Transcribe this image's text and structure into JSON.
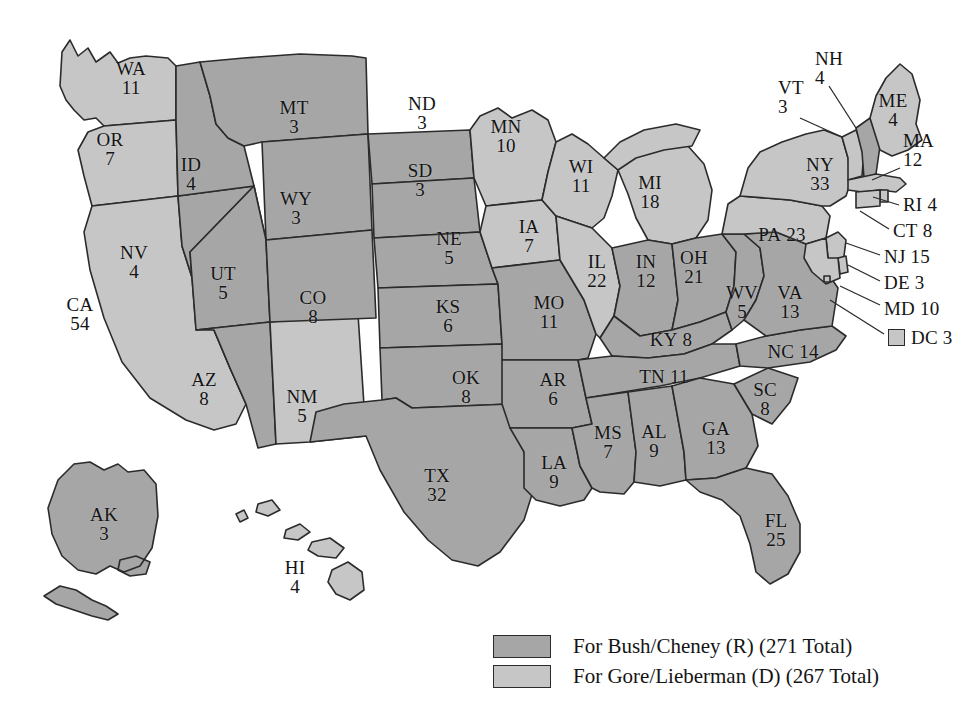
{
  "figure": {
    "colors": {
      "republican_fill": "#a6a6a6",
      "democrat_fill": "#c6c6c6",
      "border": "#2b2b2b",
      "background": "#ffffff"
    }
  },
  "legend": {
    "items": [
      {
        "swatch": "rep",
        "text": "For Bush/Cheney (R) (271 Total)"
      },
      {
        "swatch": "dem",
        "text": "For Gore/Lieberman (D) (267 Total)"
      }
    ]
  },
  "chart_data": {
    "type": "map",
    "legend_position": "bottom-right",
    "categories": [
      "For Bush/Cheney (R)",
      "For Gore/Lieberman (D)"
    ],
    "values": [
      271,
      267
    ],
    "totals": {
      "bush_cheney": 271,
      "gore_lieberman": 267
    },
    "series": [
      {
        "name": "For Bush/Cheney (R)",
        "total": 271,
        "states": [
          {
            "abbr": "MT",
            "ev": 3
          },
          {
            "abbr": "ID",
            "ev": 4
          },
          {
            "abbr": "WY",
            "ev": 3
          },
          {
            "abbr": "ND",
            "ev": 3
          },
          {
            "abbr": "SD",
            "ev": 3
          },
          {
            "abbr": "NE",
            "ev": 5
          },
          {
            "abbr": "NV",
            "ev": 4
          },
          {
            "abbr": "UT",
            "ev": 5
          },
          {
            "abbr": "CO",
            "ev": 8
          },
          {
            "abbr": "KS",
            "ev": 6
          },
          {
            "abbr": "AZ",
            "ev": 8
          },
          {
            "abbr": "OK",
            "ev": 8
          },
          {
            "abbr": "TX",
            "ev": 32
          },
          {
            "abbr": "MO",
            "ev": 11
          },
          {
            "abbr": "AR",
            "ev": 6
          },
          {
            "abbr": "LA",
            "ev": 9
          },
          {
            "abbr": "MS",
            "ev": 7
          },
          {
            "abbr": "AL",
            "ev": 9
          },
          {
            "abbr": "GA",
            "ev": 13
          },
          {
            "abbr": "FL",
            "ev": 25
          },
          {
            "abbr": "SC",
            "ev": 8
          },
          {
            "abbr": "NC",
            "ev": 14
          },
          {
            "abbr": "TN",
            "ev": 11
          },
          {
            "abbr": "KY",
            "ev": 8
          },
          {
            "abbr": "VA",
            "ev": 13
          },
          {
            "abbr": "WV",
            "ev": 5
          },
          {
            "abbr": "OH",
            "ev": 21
          },
          {
            "abbr": "IN",
            "ev": 12
          },
          {
            "abbr": "NH",
            "ev": 4
          },
          {
            "abbr": "AK",
            "ev": 3
          }
        ]
      },
      {
        "name": "For Gore/Lieberman (D)",
        "total": 267,
        "states": [
          {
            "abbr": "WA",
            "ev": 11
          },
          {
            "abbr": "OR",
            "ev": 7
          },
          {
            "abbr": "CA",
            "ev": 54
          },
          {
            "abbr": "NM",
            "ev": 5
          },
          {
            "abbr": "MN",
            "ev": 10
          },
          {
            "abbr": "IA",
            "ev": 7
          },
          {
            "abbr": "WI",
            "ev": 11
          },
          {
            "abbr": "IL",
            "ev": 22
          },
          {
            "abbr": "MI",
            "ev": 18
          },
          {
            "abbr": "PA",
            "ev": 23
          },
          {
            "abbr": "NY",
            "ev": 33
          },
          {
            "abbr": "VT",
            "ev": 3
          },
          {
            "abbr": "ME",
            "ev": 4
          },
          {
            "abbr": "MA",
            "ev": 12
          },
          {
            "abbr": "RI",
            "ev": 4
          },
          {
            "abbr": "CT",
            "ev": 8
          },
          {
            "abbr": "NJ",
            "ev": 15
          },
          {
            "abbr": "DE",
            "ev": 3
          },
          {
            "abbr": "MD",
            "ev": 10
          },
          {
            "abbr": "DC",
            "ev": 3
          },
          {
            "abbr": "HI",
            "ev": 4
          }
        ]
      }
    ]
  },
  "map": {
    "labels": [
      {
        "id": "wa",
        "abbr": "WA",
        "ev": "11",
        "party": "dem",
        "x": 131,
        "y": 78,
        "layout": "stacked"
      },
      {
        "id": "or",
        "abbr": "OR",
        "ev": "7",
        "party": "dem",
        "x": 110,
        "y": 149,
        "layout": "stacked"
      },
      {
        "id": "ca",
        "abbr": "CA",
        "ev": "54",
        "party": "dem",
        "x": 80,
        "y": 314,
        "layout": "stacked"
      },
      {
        "id": "id",
        "abbr": "ID",
        "ev": "4",
        "party": "rep",
        "x": 191,
        "y": 174,
        "layout": "stacked"
      },
      {
        "id": "nv",
        "abbr": "NV",
        "ev": "4",
        "party": "rep",
        "x": 134,
        "y": 262,
        "layout": "stacked"
      },
      {
        "id": "ut",
        "abbr": "UT",
        "ev": "5",
        "party": "rep",
        "x": 223,
        "y": 283,
        "layout": "stacked"
      },
      {
        "id": "az",
        "abbr": "AZ",
        "ev": "8",
        "party": "rep",
        "x": 204,
        "y": 389,
        "layout": "stacked"
      },
      {
        "id": "mt",
        "abbr": "MT",
        "ev": "3",
        "party": "rep",
        "x": 294,
        "y": 117,
        "layout": "stacked"
      },
      {
        "id": "wy",
        "abbr": "WY",
        "ev": "3",
        "party": "rep",
        "x": 296,
        "y": 208,
        "layout": "stacked"
      },
      {
        "id": "co",
        "abbr": "CO",
        "ev": "8",
        "party": "rep",
        "x": 313,
        "y": 307,
        "layout": "stacked"
      },
      {
        "id": "nm",
        "abbr": "NM",
        "ev": "5",
        "party": "dem",
        "x": 302,
        "y": 406,
        "layout": "stacked"
      },
      {
        "id": "nd",
        "abbr": "ND",
        "ev": "3",
        "party": "rep",
        "x": 422,
        "y": 113,
        "layout": "stacked"
      },
      {
        "id": "sd",
        "abbr": "SD",
        "ev": "3",
        "party": "rep",
        "x": 420,
        "y": 180,
        "layout": "stacked"
      },
      {
        "id": "ne",
        "abbr": "NE",
        "ev": "5",
        "party": "rep",
        "x": 449,
        "y": 248,
        "layout": "stacked"
      },
      {
        "id": "ks",
        "abbr": "KS",
        "ev": "6",
        "party": "rep",
        "x": 448,
        "y": 316,
        "layout": "stacked"
      },
      {
        "id": "ok",
        "abbr": "OK",
        "ev": "8",
        "party": "rep",
        "x": 466,
        "y": 387,
        "layout": "stacked"
      },
      {
        "id": "tx",
        "abbr": "TX",
        "ev": "32",
        "party": "rep",
        "x": 437,
        "y": 485,
        "layout": "stacked"
      },
      {
        "id": "mn",
        "abbr": "MN",
        "ev": "10",
        "party": "dem",
        "x": 506,
        "y": 136,
        "layout": "stacked"
      },
      {
        "id": "ia",
        "abbr": "IA",
        "ev": "7",
        "party": "dem",
        "x": 529,
        "y": 236,
        "layout": "stacked"
      },
      {
        "id": "mo",
        "abbr": "MO",
        "ev": "11",
        "party": "rep",
        "x": 549,
        "y": 312,
        "layout": "stacked"
      },
      {
        "id": "ar",
        "abbr": "AR",
        "ev": "6",
        "party": "rep",
        "x": 553,
        "y": 389,
        "layout": "stacked"
      },
      {
        "id": "la",
        "abbr": "LA",
        "ev": "9",
        "party": "rep",
        "x": 554,
        "y": 472,
        "layout": "stacked"
      },
      {
        "id": "wi",
        "abbr": "WI",
        "ev": "11",
        "party": "dem",
        "x": 581,
        "y": 176,
        "layout": "stacked"
      },
      {
        "id": "il",
        "abbr": "IL",
        "ev": "22",
        "party": "dem",
        "x": 597,
        "y": 271,
        "layout": "stacked"
      },
      {
        "id": "ms",
        "abbr": "MS",
        "ev": "7",
        "party": "rep",
        "x": 608,
        "y": 442,
        "layout": "stacked"
      },
      {
        "id": "mi",
        "abbr": "MI",
        "ev": "18",
        "party": "dem",
        "x": 650,
        "y": 192,
        "layout": "stacked"
      },
      {
        "id": "in",
        "abbr": "IN",
        "ev": "12",
        "party": "rep",
        "x": 646,
        "y": 271,
        "layout": "stacked"
      },
      {
        "id": "al",
        "abbr": "AL",
        "ev": "9",
        "party": "rep",
        "x": 654,
        "y": 441,
        "layout": "stacked"
      },
      {
        "id": "oh",
        "abbr": "OH",
        "ev": "21",
        "party": "rep",
        "x": 694,
        "y": 267,
        "layout": "stacked"
      },
      {
        "id": "ky",
        "abbr": "KY",
        "ev": "8",
        "party": "rep",
        "x": 671,
        "y": 340,
        "layout": "inline"
      },
      {
        "id": "tn",
        "abbr": "TN",
        "ev": "11",
        "party": "rep",
        "x": 664,
        "y": 377,
        "layout": "inline"
      },
      {
        "id": "ga",
        "abbr": "GA",
        "ev": "13",
        "party": "rep",
        "x": 716,
        "y": 438,
        "layout": "stacked"
      },
      {
        "id": "wv",
        "abbr": "WV",
        "ev": "5",
        "party": "rep",
        "x": 742,
        "y": 302,
        "layout": "stacked"
      },
      {
        "id": "va",
        "abbr": "VA",
        "ev": "13",
        "party": "rep",
        "x": 790,
        "y": 302,
        "layout": "stacked"
      },
      {
        "id": "pa",
        "abbr": "PA",
        "ev": "23",
        "party": "dem",
        "x": 782,
        "y": 235,
        "layout": "inline"
      },
      {
        "id": "ny",
        "abbr": "NY",
        "ev": "33",
        "party": "dem",
        "x": 820,
        "y": 174,
        "layout": "stacked"
      },
      {
        "id": "nc",
        "abbr": "NC",
        "ev": "14",
        "party": "rep",
        "x": 793,
        "y": 352,
        "layout": "inline"
      },
      {
        "id": "sc",
        "abbr": "SC",
        "ev": "8",
        "party": "rep",
        "x": 765,
        "y": 399,
        "layout": "stacked"
      },
      {
        "id": "fl",
        "abbr": "FL",
        "ev": "25",
        "party": "rep",
        "x": 776,
        "y": 530,
        "layout": "stacked"
      },
      {
        "id": "me",
        "abbr": "ME",
        "ev": "4",
        "party": "dem",
        "x": 893,
        "y": 110,
        "layout": "stacked"
      },
      {
        "id": "ak",
        "abbr": "AK",
        "ev": "3",
        "party": "rep",
        "x": 104,
        "y": 524,
        "layout": "stacked"
      },
      {
        "id": "hi",
        "abbr": "HI",
        "ev": "4",
        "party": "dem",
        "x": 295,
        "y": 577,
        "layout": "stacked"
      }
    ],
    "callouts": [
      {
        "id": "nh",
        "abbr": "NH",
        "ev": "4",
        "party": "rep",
        "x": 815,
        "y": 68,
        "layout": "stacked",
        "line": [
          [
            829,
            86
          ],
          [
            856,
            128
          ]
        ]
      },
      {
        "id": "vt",
        "abbr": "VT",
        "ev": "3",
        "party": "dem",
        "x": 778,
        "y": 97,
        "layout": "stacked",
        "line": [
          [
            800,
            118
          ],
          [
            842,
            137
          ]
        ]
      },
      {
        "id": "ma",
        "abbr": "MA",
        "ev": "12",
        "party": "dem",
        "x": 903,
        "y": 150,
        "layout": "stacked",
        "line": [
          [
            900,
            168
          ],
          [
            872,
            180
          ]
        ]
      },
      {
        "id": "ri",
        "abbr": "RI",
        "ev": "4",
        "party": "dem",
        "x": 903,
        "y": 205,
        "layout": "inline",
        "line": [
          [
            899,
            205
          ],
          [
            873,
            197
          ]
        ]
      },
      {
        "id": "ct",
        "abbr": "CT",
        "ev": "8",
        "party": "dem",
        "x": 893,
        "y": 231,
        "layout": "inline",
        "line": [
          [
            889,
            229
          ],
          [
            860,
            211
          ]
        ]
      },
      {
        "id": "nj",
        "abbr": "NJ",
        "ev": "15",
        "party": "dem",
        "x": 884,
        "y": 257,
        "layout": "inline",
        "line": [
          [
            880,
            255
          ],
          [
            846,
            243
          ]
        ]
      },
      {
        "id": "de",
        "abbr": "DE",
        "ev": "3",
        "party": "dem",
        "x": 884,
        "y": 283,
        "layout": "inline",
        "line": [
          [
            880,
            281
          ],
          [
            848,
            265
          ]
        ]
      },
      {
        "id": "md",
        "abbr": "MD",
        "ev": "10",
        "party": "dem",
        "x": 884,
        "y": 309,
        "layout": "inline",
        "line": [
          [
            880,
            305
          ],
          [
            840,
            286
          ]
        ]
      },
      {
        "id": "dc",
        "abbr": "DC",
        "ev": "3",
        "party": "dem",
        "x": 888,
        "y": 338,
        "layout": "inline",
        "line": [
          [
            884,
            334
          ],
          [
            830,
            300
          ]
        ],
        "swatch": true
      }
    ]
  }
}
